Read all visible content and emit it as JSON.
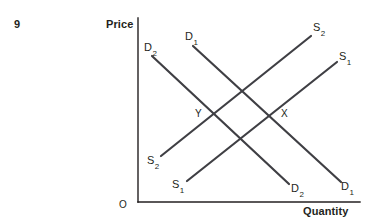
{
  "figure": {
    "question_number": "9",
    "origin_label": "O",
    "axes": {
      "y_axis_title": "Price",
      "x_axis_title": "Quantity",
      "y_axis_line": {
        "x1": 138,
        "y1": 18,
        "x2": 138,
        "y2": 202
      },
      "x_axis_line": {
        "x1": 138,
        "y1": 202,
        "x2": 360,
        "y2": 202
      },
      "axis_color": "#231f20",
      "axis_width": 1.4
    },
    "curve_color": "#3f3f44",
    "curve_width": 2.2,
    "curves": [
      {
        "id": "demand-1",
        "name": "D1",
        "base": "D",
        "subscript": "1",
        "kind": "demand",
        "x1": 193,
        "y1": 46,
        "x2": 341,
        "y2": 182,
        "label_top": "D",
        "label_top_sub": "1",
        "label_bottom": "D",
        "label_bottom_sub": "1"
      },
      {
        "id": "demand-2",
        "name": "D2",
        "base": "D",
        "subscript": "2",
        "kind": "demand",
        "x1": 152,
        "y1": 56,
        "x2": 289,
        "y2": 184,
        "label_top": "D",
        "label_top_sub": "2",
        "label_bottom": "D",
        "label_bottom_sub": "2"
      },
      {
        "id": "supply-1",
        "name": "S1",
        "base": "S",
        "subscript": "1",
        "kind": "supply",
        "x1": 187,
        "y1": 181,
        "x2": 337,
        "y2": 62,
        "label_top": "S",
        "label_top_sub": "1",
        "label_bottom": "S",
        "label_bottom_sub": "1"
      },
      {
        "id": "supply-2",
        "name": "S2",
        "base": "S",
        "subscript": "2",
        "kind": "supply",
        "x1": 161,
        "y1": 156,
        "x2": 311,
        "y2": 36,
        "label_top": "S",
        "label_top_sub": "2",
        "label_bottom": "S",
        "label_bottom_sub": "2"
      }
    ],
    "points": [
      {
        "id": "point-y",
        "label": "Y",
        "x": 199,
        "y": 115
      },
      {
        "id": "point-x",
        "label": "X",
        "x": 285,
        "y": 115
      }
    ]
  }
}
